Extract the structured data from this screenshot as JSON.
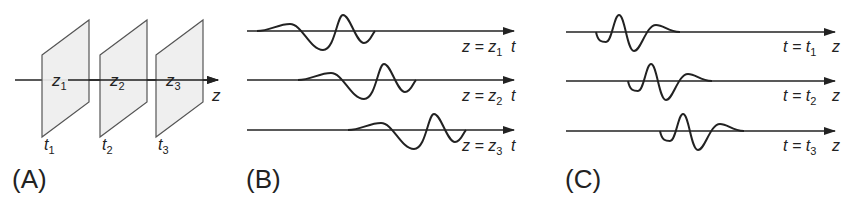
{
  "panels": [
    {
      "label": "(A)",
      "planes": [
        {
          "name": "z",
          "sub": "1",
          "time": "t",
          "time_sub": "1"
        },
        {
          "name": "z",
          "sub": "2",
          "time": "t",
          "time_sub": "2"
        },
        {
          "name": "z",
          "sub": "3",
          "time": "t",
          "time_sub": "3"
        }
      ],
      "axis_label": "z"
    },
    {
      "label": "(B)",
      "axis_label": "t",
      "rows": [
        {
          "eq": "z = z",
          "sub": "1"
        },
        {
          "eq": "z = z",
          "sub": "2"
        },
        {
          "eq": "z = z",
          "sub": "3"
        }
      ]
    },
    {
      "label": "(C)",
      "axis_label": "z",
      "rows": [
        {
          "eq": "t = t",
          "sub": "1"
        },
        {
          "eq": "t = t",
          "sub": "2"
        },
        {
          "eq": "t = t",
          "sub": "3"
        }
      ]
    }
  ],
  "colors": {
    "stroke": "#222222",
    "plane_fill": "#eeeeee",
    "plane_stroke": "#555555"
  }
}
